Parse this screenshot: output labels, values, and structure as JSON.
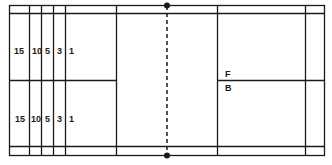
{
  "diagram": {
    "type": "court-layout",
    "line_color": "#1a1a1a",
    "left_zone_labels_top": [
      "15",
      "10",
      "5",
      "3",
      "1"
    ],
    "left_zone_labels_bottom": [
      "15",
      "10",
      "5",
      "3",
      "1"
    ],
    "right_zone_labels": {
      "front": "F",
      "back": "B"
    }
  }
}
